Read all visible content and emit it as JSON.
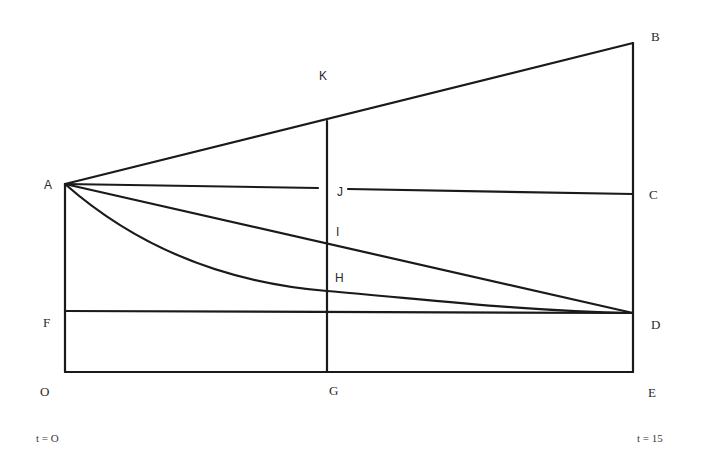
{
  "diagram": {
    "type": "geometric-time-diagram",
    "points": {
      "A": {
        "label": "A",
        "x": 65,
        "y": 184
      },
      "B": {
        "label": "B",
        "x": 633,
        "y": 43
      },
      "C": {
        "label": "C",
        "x": 633,
        "y": 194
      },
      "D": {
        "label": "D",
        "x": 633,
        "y": 313
      },
      "E": {
        "label": "E",
        "x": 633,
        "y": 372
      },
      "F": {
        "label": "F",
        "x": 65,
        "y": 311
      },
      "G": {
        "label": "G",
        "x": 327,
        "y": 372
      },
      "H": {
        "label": "H",
        "x": 327,
        "y": 291
      },
      "I": {
        "label": "I",
        "x": 327,
        "y": 246
      },
      "J": {
        "label": "J",
        "x": 327,
        "y": 189
      },
      "K": {
        "label": "K",
        "x": 327,
        "y": 120
      },
      "O": {
        "label": "O",
        "x": 65,
        "y": 372
      }
    },
    "segments": [
      {
        "name": "AB",
        "from": "A",
        "to": "B"
      },
      {
        "name": "AJ",
        "from": "A",
        "to": "J",
        "note": "line A to C broken around label J"
      },
      {
        "name": "JC",
        "from": "J",
        "to": "C"
      },
      {
        "name": "AD",
        "from": "A",
        "to": "D",
        "kind": "straight"
      },
      {
        "name": "AHD",
        "from": "A",
        "to": "D",
        "kind": "curve",
        "through": "H"
      },
      {
        "name": "FD",
        "from": "F",
        "to": "D"
      },
      {
        "name": "OE",
        "from": "O",
        "to": "E"
      },
      {
        "name": "AO",
        "from": "A",
        "to": "O"
      },
      {
        "name": "BE",
        "from": "B",
        "to": "E"
      },
      {
        "name": "KG",
        "from": "K",
        "to": "G"
      }
    ],
    "labels": {
      "A": "A",
      "B": "B",
      "C": "C",
      "D": "D",
      "E": "E",
      "F": "F",
      "G": "G",
      "H": "H",
      "I": "I",
      "J": "J",
      "K": "K",
      "O": "O"
    },
    "time_labels": {
      "start": "t = O",
      "end": "t = 15"
    },
    "colors": {
      "line": "#1a1a1a",
      "text": "#2a2a2a",
      "background": "#ffffff"
    }
  }
}
